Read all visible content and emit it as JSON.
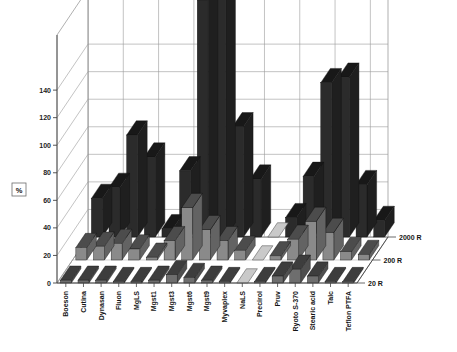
{
  "chart_data": {
    "type": "bar",
    "subtype": "3d-grouped-bar",
    "title": "Increase in disintegration time, %",
    "xlabel": "",
    "ylabel": "%",
    "zlabel": "",
    "ylim": [
      0,
      180
    ],
    "yticks": [
      0,
      20,
      40,
      60,
      80,
      100,
      120,
      140
    ],
    "grid": true,
    "legend_position": "right-depth-axis",
    "categories": [
      "Boeson",
      "Cutina",
      "Dynasan",
      "Fluon",
      "MgLS",
      "Mgst1",
      "Mgst3",
      "Mgst6",
      "Mgst9",
      "Myvaplex",
      "NaLS",
      "Precirol",
      "Pruv",
      "Ryoto S-370",
      "Stearic acid",
      "Talc",
      "Teflon PTFA"
    ],
    "series": [
      {
        "name": "20 R",
        "color": "#6e6e6e",
        "values": [
          2,
          2,
          2,
          1,
          1,
          2,
          6,
          4,
          2,
          1,
          0,
          1,
          5,
          10,
          5,
          1,
          1
        ]
      },
      {
        "name": "200 R",
        "color": "#8a8a8a",
        "values": [
          9,
          10,
          12,
          8,
          2,
          14,
          38,
          22,
          14,
          7,
          0,
          3,
          15,
          28,
          20,
          6,
          4
        ]
      },
      {
        "name": "2000 R",
        "color": "#2b2b2b",
        "values": [
          28,
          36,
          74,
          58,
          6,
          48,
          172,
          178,
          80,
          42,
          0,
          14,
          44,
          112,
          116,
          38,
          12
        ]
      }
    ]
  },
  "axis": {
    "y_label": "%",
    "y_tick_labels": [
      "0",
      "20",
      "40",
      "60",
      "80",
      "100",
      "120",
      "140"
    ],
    "series_labels": [
      "2000 R",
      "200 R",
      "20 R"
    ]
  },
  "colors": {
    "bar_front_dark": "#2b2b2b",
    "bar_front_mid": "#8a8a8a",
    "bar_front_light": "#9a9a9a",
    "bar_top": "#1b1b1b",
    "bar_side": "#3a3a3a",
    "grid": "#9a9a9a",
    "wall": "#ffffff",
    "floor": "#ffffff",
    "text": "#151515"
  }
}
